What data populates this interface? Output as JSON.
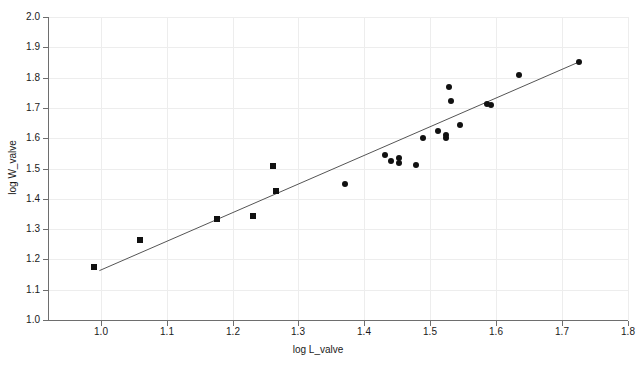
{
  "chart_data": {
    "type": "scatter",
    "title": "",
    "xlabel": "log L_valve",
    "ylabel": "log W_valve",
    "xlim": [
      0.92,
      1.8
    ],
    "ylim": [
      1.0,
      2.0
    ],
    "xticks": [
      "1.0",
      "1.1",
      "1.2",
      "1.3",
      "1.4",
      "1.5",
      "1.6",
      "1.7",
      "1.8"
    ],
    "xtick_values": [
      1.0,
      1.1,
      1.2,
      1.3,
      1.4,
      1.5,
      1.6,
      1.7,
      1.8
    ],
    "yticks": [
      "1.0",
      "1.1",
      "1.2",
      "1.3",
      "1.4",
      "1.5",
      "1.6",
      "1.7",
      "1.8",
      "1.9",
      "2.0"
    ],
    "ytick_values": [
      1.0,
      1.1,
      1.2,
      1.3,
      1.4,
      1.5,
      1.6,
      1.7,
      1.8,
      1.9,
      2.0
    ],
    "grid": true,
    "legend": "none",
    "marker_color": "#111111",
    "line_color": "#555555",
    "series": [
      {
        "name": "squares",
        "marker": "square",
        "points": [
          {
            "x": 0.99,
            "y": 1.175
          },
          {
            "x": 1.06,
            "y": 1.265
          },
          {
            "x": 1.177,
            "y": 1.334
          },
          {
            "x": 1.231,
            "y": 1.344
          },
          {
            "x": 1.262,
            "y": 1.508
          },
          {
            "x": 1.266,
            "y": 1.425
          }
        ]
      },
      {
        "name": "circles",
        "marker": "circle",
        "points": [
          {
            "x": 1.37,
            "y": 1.45
          },
          {
            "x": 1.432,
            "y": 1.545
          },
          {
            "x": 1.44,
            "y": 1.525
          },
          {
            "x": 1.452,
            "y": 1.535
          },
          {
            "x": 1.452,
            "y": 1.518
          },
          {
            "x": 1.478,
            "y": 1.512
          },
          {
            "x": 1.489,
            "y": 1.6
          },
          {
            "x": 1.512,
            "y": 1.623
          },
          {
            "x": 1.524,
            "y": 1.61
          },
          {
            "x": 1.524,
            "y": 1.6
          },
          {
            "x": 1.528,
            "y": 1.77
          },
          {
            "x": 1.531,
            "y": 1.722
          },
          {
            "x": 1.545,
            "y": 1.644
          },
          {
            "x": 1.586,
            "y": 1.712
          },
          {
            "x": 1.592,
            "y": 1.708
          },
          {
            "x": 1.634,
            "y": 1.808
          },
          {
            "x": 1.725,
            "y": 1.851
          }
        ]
      }
    ],
    "fit_line": {
      "name": "regression-line",
      "x_start": 0.998,
      "y_start": 1.163,
      "x_end": 1.725,
      "y_end": 1.851
    }
  }
}
